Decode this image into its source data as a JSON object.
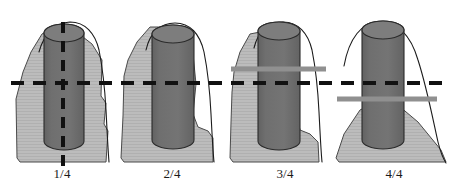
{
  "figure": {
    "background_color": "#ffffff",
    "width": 457,
    "height": 190
  },
  "colors": {
    "bone_fill": "#b9b9b9",
    "bone_stroke": "#4a4a4a",
    "implant_fill": "#6e6e6e",
    "implant_stroke": "#2b2b2b",
    "implant_top_fill": "#7d7d7d",
    "outline_stroke": "#1c1c1c",
    "dashed_line": "#111111",
    "marker_bar": "#909090",
    "label_text": "#1a1a1a"
  },
  "reference_line": {
    "name": "horizontal-reference-line",
    "orientation": "horizontal",
    "style": "dashed",
    "y": 83,
    "x_start": 11,
    "x_end": 446,
    "thickness": 4,
    "dash": "13 9"
  },
  "axis_line": {
    "name": "vertical-axis-line",
    "orientation": "vertical",
    "style": "dashed",
    "x": 63,
    "y_start": 22,
    "y_end": 168,
    "thickness": 4,
    "dash": "11 8"
  },
  "panels": [
    {
      "id": "panel-1",
      "label": "1/4",
      "label_x": 62,
      "has_vertical_dashed_line": true,
      "has_marker_bar": false,
      "marker_bar": null,
      "bone_path": "M 16 99 L 17 158 L 20 162 L 106 162 L 108 131 L 104 124 L 106 103 L 101 96 L 102 60 L 92 44 L 74 30 L 56 26 L 42 34 L 31 52 L 23 72 Z",
      "outline_path": "M 39 52 C 44 33 56 23 70 22 C 85 22 95 33 99 50 C 103 70 105 92 106 110 C 107 130 108 150 109 162",
      "implant": {
        "x": 44,
        "y": 24,
        "width": 40,
        "height": 126,
        "ellipse_ry": 9
      }
    },
    {
      "id": "panel-2",
      "label": "2/4",
      "label_x": 172,
      "has_vertical_dashed_line": false,
      "has_marker_bar": false,
      "marker_bar": null,
      "bone_path": "M 124 76 L 123 116 L 121 158 L 124 162 L 213 162 L 213 138 L 208 131 L 198 127 L 193 114 L 196 84 L 193 54 L 184 38 L 168 27 L 150 27 L 137 42 L 128 60 Z",
      "outline_path": "M 146 50 C 150 32 161 23 175 23 C 190 23 200 34 204 52 C 208 72 210 94 211 114 C 212 134 213 152 214 162",
      "implant": {
        "x": 152,
        "y": 25,
        "width": 42,
        "height": 124,
        "ellipse_ry": 9
      }
    },
    {
      "id": "panel-3",
      "label": "3/4",
      "label_x": 285,
      "has_vertical_dashed_line": false,
      "has_marker_bar": true,
      "marker_bar": {
        "name": "bone-level-marker-bar",
        "x_start": 231,
        "x_end": 326,
        "y": 69,
        "thickness": 5
      },
      "bone_path": "M 232 92 L 231 122 L 230 158 L 233 162 L 319 162 L 318 142 L 310 134 L 300 130 L 296 110 L 298 80 L 292 56 L 281 40 L 265 31 L 250 34 L 240 52 L 234 72 Z",
      "outline_path": "M 254 48 C 258 31 269 22 283 22 C 298 22 308 33 312 50 C 316 70 318 92 319 112 C 320 132 321 152 322 162",
      "implant": {
        "x": 258,
        "y": 22,
        "width": 42,
        "height": 128,
        "ellipse_ry": 9
      }
    },
    {
      "id": "panel-4",
      "label": "4/4",
      "label_x": 394,
      "has_vertical_dashed_line": false,
      "has_marker_bar": true,
      "marker_bar": {
        "name": "bone-level-marker-bar",
        "x_start": 337,
        "x_end": 437,
        "y": 99,
        "thickness": 5
      },
      "bone_path": "M 336 158 L 339 162 L 446 162 L 441 150 L 418 122 L 399 106 L 380 100 L 360 110 L 344 134 Z",
      "outline_path": "M 344 66 C 349 38 362 22 379 22 C 398 22 411 36 418 60 C 427 88 433 120 438 142 C 441 154 444 160 446 163",
      "implant": {
        "x": 362,
        "y": 21,
        "width": 42,
        "height": 128,
        "ellipse_ry": 9
      }
    }
  ]
}
